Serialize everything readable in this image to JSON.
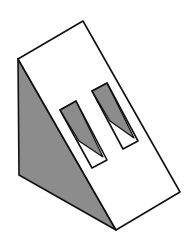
{
  "diagram": {
    "title": "Triangular prism (wedge) with two rectangular slots",
    "colors": {
      "stroke": "#111111",
      "shaded_face": "#8c8c8c",
      "lit_face": "#ffffff",
      "background": "#ffffff"
    },
    "vertices": {
      "top": [
        83,
        21
      ],
      "left_top": [
        18,
        59
      ],
      "left_bottom": [
        19,
        175
      ],
      "bottom": [
        116,
        230
      ],
      "right": [
        180,
        192
      ]
    },
    "slots": [
      {
        "name": "left-slot",
        "corners": [
          [
            60,
            110
          ],
          [
            76,
            101
          ],
          [
            107,
            160
          ],
          [
            92,
            168
          ]
        ],
        "shadow": [
          [
            60,
            110
          ],
          [
            76,
            101
          ],
          [
            103,
            157
          ],
          [
            79,
            141
          ]
        ]
      },
      {
        "name": "right-slot",
        "corners": [
          [
            92,
            91
          ],
          [
            107,
            83
          ],
          [
            138,
            141
          ],
          [
            123,
            149
          ]
        ],
        "shadow": [
          [
            92,
            91
          ],
          [
            107,
            83
          ],
          [
            134,
            138
          ],
          [
            110,
            121
          ]
        ]
      }
    ]
  }
}
